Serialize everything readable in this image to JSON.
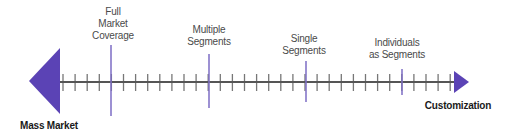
{
  "diagram": {
    "type": "continuum",
    "colors": {
      "accent": "#5b43b5",
      "axis": "#555555",
      "marker": "#7c6cc4",
      "text": "#4a4a4a"
    },
    "left_end": {
      "label": "Mass Market"
    },
    "right_end": {
      "label": "Customization"
    },
    "markers": [
      {
        "label_line1": "Full",
        "label_line2": "Market",
        "label_line3": "Coverage",
        "x": 111
      },
      {
        "label_line1": "Multiple",
        "label_line2": "Segments",
        "x": 209
      },
      {
        "label_line1": "Single",
        "label_line2": "Segments",
        "x": 306
      },
      {
        "label_line1": "Individuals",
        "label_line2": "as Segments",
        "x": 402
      }
    ],
    "tick_count": 33
  }
}
